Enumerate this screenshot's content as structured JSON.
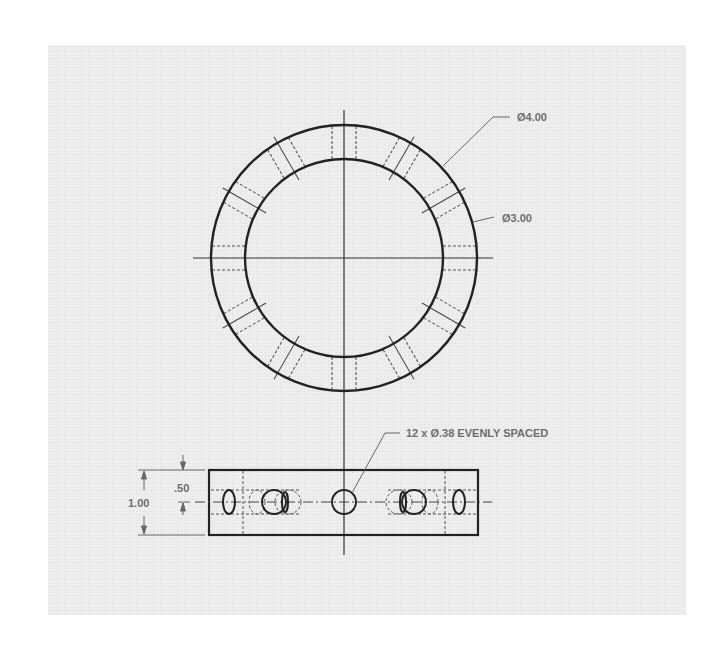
{
  "drawing": {
    "type": "engineering-drawing",
    "views": [
      "top-view",
      "front-view"
    ],
    "top_view": {
      "outer_diameter_label": "Ø4.00",
      "inner_diameter_label": "Ø3.00",
      "hole_count": 12
    },
    "front_view": {
      "hole_callout": "12 x Ø.38 EVENLY SPACED",
      "height_dimension": "1.00",
      "hole_center_dimension": ".50"
    },
    "colors": {
      "paper": "#ececec",
      "line": "#2a2a2a",
      "hidden_line": "#555555",
      "text": "#6e6e6e"
    }
  }
}
